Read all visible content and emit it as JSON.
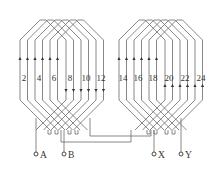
{
  "diagram": {
    "type": "stator winding diagram",
    "colors": {
      "line": "#6a6a6a",
      "text": "#333333",
      "background": "#ffffff"
    },
    "slot_labels_left": [
      "2",
      "4",
      "6",
      "8",
      "10",
      "12"
    ],
    "slot_labels_right": [
      "14",
      "16",
      "18",
      "20",
      "22",
      "24"
    ],
    "terminals": [
      {
        "id": "A",
        "label": "A"
      },
      {
        "id": "B",
        "label": "B"
      },
      {
        "id": "X",
        "label": "X"
      },
      {
        "id": "Y",
        "label": "Y"
      }
    ],
    "groups": [
      {
        "name": "left-coil-group",
        "up_arrows": 6,
        "down_arrows": 6
      },
      {
        "name": "right-coil-group",
        "up_arrows": 6,
        "up_arrows_lower": 6
      }
    ]
  }
}
